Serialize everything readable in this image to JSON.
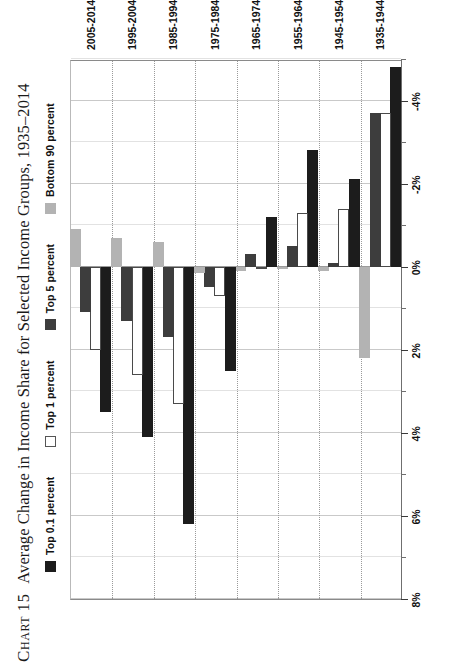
{
  "figure": {
    "chart_label": "Chart",
    "chart_number": "15",
    "title": "Average Change in Income Share for Selected Income Groups, 1935–2014"
  },
  "legend": {
    "position": "top",
    "items": [
      {
        "label": "Top 0.1 percent",
        "color": "#1c1c1c",
        "key": "top01"
      },
      {
        "label": "Top 1 percent",
        "color": "#ffffff",
        "key": "top1"
      },
      {
        "label": "Top 5 percent",
        "color": "#3d3d3d",
        "key": "top5"
      },
      {
        "label": "Bottom 90 percent",
        "color": "#b3b3b3",
        "key": "bot90"
      }
    ]
  },
  "axis": {
    "tick_labels": [
      "8%",
      "6%",
      "4%",
      "2%",
      "0%",
      "-2%",
      "-4%"
    ],
    "tick_values": [
      8,
      6,
      4,
      2,
      0,
      -2,
      -4
    ],
    "min": 8,
    "max": -5,
    "minor_step": 1
  },
  "chart_data": {
    "type": "bar",
    "orientation": "horizontal",
    "title": "Chart 15  Average Change in Income Share for Selected Income Groups, 1935–2014",
    "xlabel": "",
    "ylabel": "",
    "xlim": [
      8,
      -5
    ],
    "grid": true,
    "legend_position": "top",
    "categories": [
      "1935-1944",
      "1945-1954",
      "1955-1964",
      "1965-1974",
      "1975-1984",
      "1985-1994",
      "1995-2004",
      "2005-2014"
    ],
    "series": [
      {
        "name": "Top 0.1 percent",
        "color": "#1c1c1c",
        "values": [
          -4.8,
          -2.1,
          -2.8,
          -1.2,
          2.5,
          6.2,
          4.1,
          3.5
        ]
      },
      {
        "name": "Top 1 percent",
        "color": "#ffffff",
        "values": [
          -3.7,
          -1.4,
          -1.3,
          0.05,
          0.7,
          3.3,
          2.6,
          2.0
        ]
      },
      {
        "name": "Top 5 percent",
        "color": "#3d3d3d",
        "values": [
          -3.7,
          -0.1,
          -0.5,
          -0.3,
          0.5,
          1.7,
          1.3,
          1.1
        ]
      },
      {
        "name": "Bottom 90 percent",
        "color": "#b3b3b3",
        "values": [
          2.2,
          0.1,
          0.05,
          0.1,
          0.15,
          -0.6,
          -0.7,
          -0.9
        ]
      }
    ]
  }
}
